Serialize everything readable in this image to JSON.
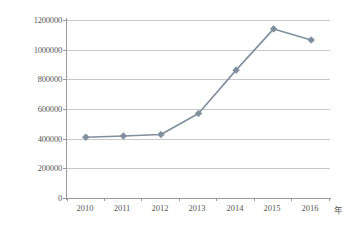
{
  "chart_data": {
    "type": "line",
    "title": "",
    "subtitle": "",
    "xlabel": "年",
    "ylabel": "",
    "categories": [
      "2010",
      "2011",
      "2012",
      "2013",
      "2014",
      "2015",
      "2016"
    ],
    "values": [
      410000,
      418000,
      428000,
      570000,
      862000,
      1140000,
      1065000
    ],
    "series": [
      {
        "name": "",
        "values": [
          410000,
          418000,
          428000,
          570000,
          862000,
          1140000,
          1065000
        ]
      }
    ],
    "ylim": [
      0,
      1200000
    ],
    "y_ticks": [
      0,
      200000,
      400000,
      600000,
      800000,
      1000000,
      1200000
    ],
    "y_tick_labels": [
      "0",
      "200000",
      "400000",
      "600000",
      "800000",
      "1000000",
      "1200000"
    ],
    "x_tick_labels": [
      "2010",
      "2011",
      "2012",
      "2013",
      "2014",
      "2015",
      "2016"
    ],
    "grid": "horizontal",
    "legend": "none",
    "marker": "diamond",
    "colors": {
      "series_line": "#7f8f9e",
      "marker_fill": "#7f8f9e",
      "gridline": "#c9c9c9",
      "axis": "#9a9a9a",
      "tick_text": "#595959",
      "background": "#ffffff"
    }
  },
  "axis": {
    "x_unit": "年"
  }
}
